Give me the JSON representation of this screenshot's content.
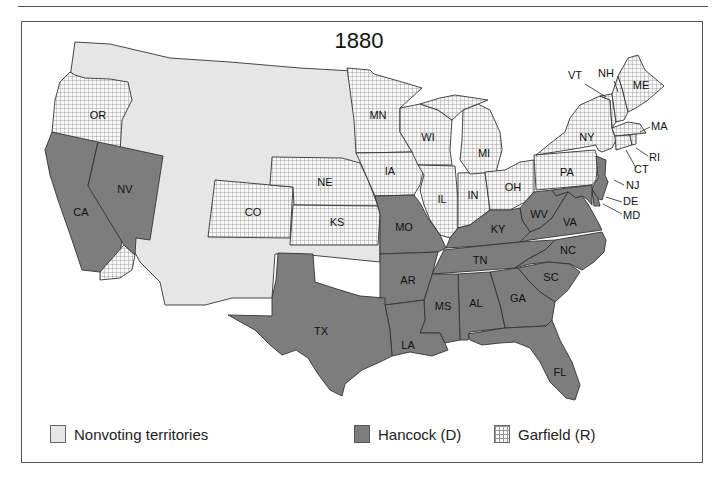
{
  "title": "1880",
  "colors": {
    "nonvoting": "#e6e6e6",
    "hancock": "#7d7d7d",
    "garfield_bg": "#f8f8f8",
    "garfield_grid": "#999999",
    "border": "#333333"
  },
  "legend": {
    "nonvoting": "Nonvoting territories",
    "hancock": "Hancock (D)",
    "garfield": "Garfield (R)"
  },
  "states": {
    "OR": "OR",
    "CA": "CA",
    "NV": "NV",
    "CO": "CO",
    "NE": "NE",
    "KS": "KS",
    "TX": "TX",
    "MN": "MN",
    "IA": "IA",
    "MO": "MO",
    "AR": "AR",
    "LA": "LA",
    "WI": "WI",
    "IL": "IL",
    "MI": "MI",
    "IN": "IN",
    "OH": "OH",
    "KY": "KY",
    "TN": "TN",
    "MS": "MS",
    "AL": "AL",
    "GA": "GA",
    "FL": "FL",
    "SC": "SC",
    "NC": "NC",
    "VA": "VA",
    "WV": "WV",
    "PA": "PA",
    "NY": "NY",
    "VT": "VT",
    "NH": "NH",
    "ME": "ME",
    "MA": "MA",
    "RI": "RI",
    "CT": "CT",
    "NJ": "NJ",
    "DE": "DE",
    "MD": "MD"
  },
  "results": {
    "hancock": [
      "CA",
      "NV",
      "TX",
      "MO",
      "AR",
      "LA",
      "MS",
      "AL",
      "GA",
      "FL",
      "SC",
      "NC",
      "VA",
      "WV",
      "KY",
      "TN",
      "NJ",
      "DE",
      "MD"
    ],
    "garfield": [
      "OR",
      "CO",
      "NE",
      "KS",
      "MN",
      "IA",
      "WI",
      "IL",
      "MI",
      "IN",
      "OH",
      "PA",
      "NY",
      "VT",
      "NH",
      "ME",
      "MA",
      "RI",
      "CT"
    ]
  }
}
